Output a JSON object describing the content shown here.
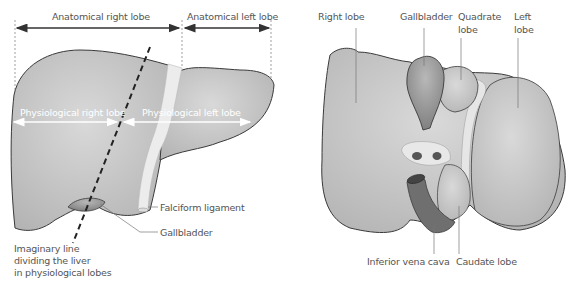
{
  "left_diagram": {
    "title": "Anterior view of liver lobes",
    "labels": {
      "anatomical_right_lobe": "Anatomical right lobe",
      "anatomical_left_lobe": "Anatomical left lobe",
      "physiological_right_lobe": "Physiological right lobe",
      "physiological_left_lobe": "Physiological left lobe",
      "falciform_ligament": "Falciform ligament",
      "gallbladder": "Gallbladder",
      "imaginary_line_1": "Imaginary line",
      "imaginary_line_2": "dividing the liver",
      "imaginary_line_3": "in physiological lobes"
    }
  },
  "right_diagram": {
    "title": "Inferior view of liver lobes",
    "labels": {
      "right_lobe": "Right lobe",
      "gallbladder": "Gallbladder",
      "quadrate_lobe_1": "Quadrate",
      "quadrate_lobe_2": "lobe",
      "left_lobe_1": "Left",
      "left_lobe_2": "lobe",
      "inferior_vena_cava": "Inferior vena cava",
      "caudate_lobe": "Caudate lobe"
    }
  },
  "colors": {
    "liver_fill": "#c8c8c8",
    "liver_stroke": "#3a3a3a",
    "gallbladder_fill": "#9a9a9a",
    "ligament_fill": "#ececec",
    "arrow_color": "#333333",
    "label_color": "#555555"
  }
}
